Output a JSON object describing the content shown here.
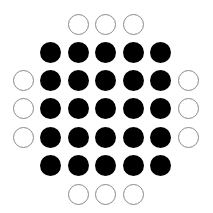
{
  "diagram": {
    "colors": {
      "filled": "#000000",
      "open_stroke": "#8a8a8a",
      "background": "#ffffff"
    },
    "grid": {
      "rows": 7,
      "cols": 7,
      "col_centers": [
        23,
        50.5,
        78,
        105.5,
        133,
        160.5,
        188
      ],
      "row_centers": [
        24,
        52,
        80,
        108.5,
        137,
        165,
        194
      ],
      "diameter": 21
    },
    "cells": [
      [
        null,
        null,
        "open",
        "open",
        "open",
        null,
        null
      ],
      [
        null,
        "filled",
        "filled",
        "filled",
        "filled",
        "filled",
        null
      ],
      [
        "open",
        "filled",
        "filled",
        "filled",
        "filled",
        "filled",
        "open"
      ],
      [
        "open",
        "filled",
        "filled",
        "filled",
        "filled",
        "filled",
        "open"
      ],
      [
        "open",
        "filled",
        "filled",
        "filled",
        "filled",
        "filled",
        "open"
      ],
      [
        null,
        "filled",
        "filled",
        "filled",
        "filled",
        "filled",
        null
      ],
      [
        null,
        null,
        "open",
        "open",
        "open",
        null,
        null
      ]
    ],
    "counts": {
      "filled": 25,
      "open": 12
    }
  }
}
